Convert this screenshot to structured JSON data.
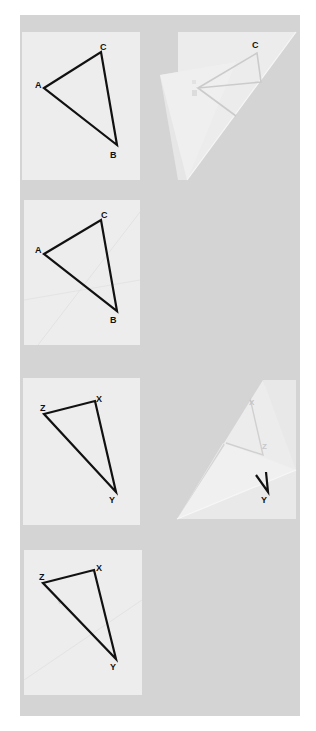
{
  "figures": [
    {
      "id": "triangle-abc-original",
      "description": "Paper with triangle ABC drawn",
      "vertices": {
        "A": "A",
        "B": "B",
        "C": "C"
      }
    },
    {
      "id": "triangle-abc-folded",
      "description": "Paper folded diagonally, triangle lines showing through",
      "vertices": {
        "C": "C"
      }
    },
    {
      "id": "triangle-abc-unfolded",
      "description": "Paper unfolded showing crease lines with triangle ABC",
      "vertices": {
        "A": "A",
        "B": "B",
        "C": "C"
      }
    },
    {
      "id": "triangle-xyz-original",
      "description": "Paper with triangle XYZ drawn",
      "vertices": {
        "X": "X",
        "Y": "Y",
        "Z": "Z"
      }
    },
    {
      "id": "triangle-xyz-folded",
      "description": "Paper folded, triangle lines showing through",
      "vertices": {
        "X": "X",
        "Y": "Y",
        "Z": "Z"
      }
    },
    {
      "id": "triangle-xyz-unfolded",
      "description": "Paper unfolded showing crease lines with triangle XYZ",
      "vertices": {
        "X": "X",
        "Y": "Y",
        "Z": "Z"
      }
    }
  ],
  "colors": {
    "background": "#ffffff",
    "panel": "#d4d4d4",
    "paper": "#ededed",
    "line": "#111111",
    "faded_line": "#c8c8c8"
  }
}
